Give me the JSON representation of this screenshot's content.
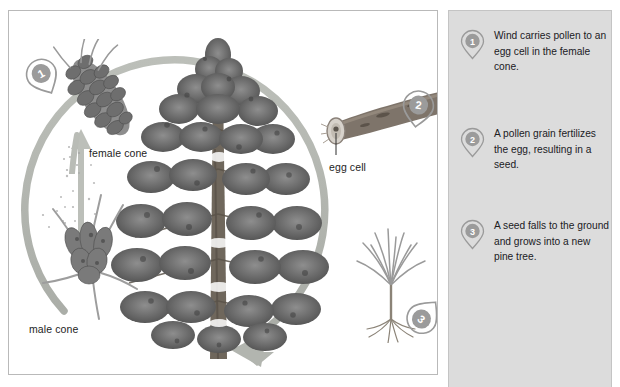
{
  "diagram": {
    "frame": {
      "border_color": "#b9b9b9",
      "background": "#ffffff"
    },
    "cycle_arrow": {
      "color": "#b3b6b0",
      "direction": "clockwise-ending-bottom-left"
    },
    "labels": {
      "female_cone": "female cone",
      "male_cone": "male cone",
      "egg_cell": "egg cell"
    },
    "markers": [
      {
        "number": "1",
        "name": "marker-1-female-cone"
      },
      {
        "number": "2",
        "name": "marker-2-egg-cell"
      },
      {
        "number": "3",
        "name": "marker-3-seedling"
      }
    ]
  },
  "side_panel": {
    "background": "#dcdcdc",
    "steps": [
      {
        "number": "1",
        "text": "Wind carries pollen to an egg cell in the female cone."
      },
      {
        "number": "2",
        "text": "A pollen grain fertilizes the egg, resulting in a seed."
      },
      {
        "number": "3",
        "text": "A seed falls to the ground and grows into a new pine tree."
      }
    ]
  },
  "colors": {
    "marker_fill": "#9b9b9b",
    "marker_stroke": "#8d8d8d",
    "marker_number": "#ffffff",
    "text": "#20201f",
    "arrow": "#b3b6b0",
    "foliage_dark": "#5d5d5d",
    "foliage_mid": "#848484",
    "trunk": "#6b6459"
  }
}
